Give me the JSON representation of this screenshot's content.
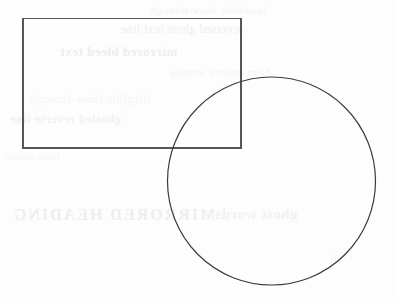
{
  "page": {
    "name": "geometry-figure-scan",
    "width": 394,
    "height": 303,
    "background_color": "#fdfdfd"
  },
  "figure": {
    "title": "",
    "shapes": [
      {
        "id": "rectangle",
        "type": "rect",
        "label": "rectangle",
        "x": 23,
        "y": 18.5,
        "width": 218,
        "height": 129.5,
        "stroke_color": "#565656",
        "stroke_width": 1.1,
        "fill": "none"
      },
      {
        "id": "circle",
        "type": "circle",
        "label": "circle",
        "cx": 271.5,
        "cy": 181,
        "r": 104,
        "stroke_color": "#3c3c3c",
        "stroke_width": 1.2,
        "fill": "none"
      }
    ],
    "overlap_note": "Circle upper-left quadrant overlaps rectangle lower-right corner"
  },
  "bleed_through": {
    "note": "faint mirrored show-through text from the reverse side of the sheet; illegible",
    "color": "#d9d9d9",
    "lines": [
      "inaudible show-through",
      "reversed ghost text line",
      "mirrored bleed text",
      "faint reverse writing",
      "illegible show-through",
      "ghosted reverse line",
      "faint marks",
      "MIRRORED HEADING",
      "ghost words",
      "faint"
    ]
  }
}
